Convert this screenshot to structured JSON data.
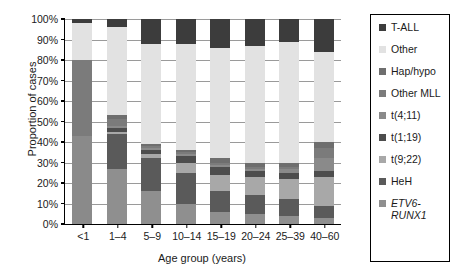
{
  "chart_data": {
    "type": "bar",
    "stacked": true,
    "title": "",
    "xlabel": "Age group (years)",
    "ylabel": "Proportion of cases",
    "ylim": [
      0,
      100
    ],
    "yunit": "%",
    "ytick_labels": [
      "0%",
      "10%",
      "20%",
      "30%",
      "40%",
      "50%",
      "60%",
      "70%",
      "80%",
      "90%",
      "100%"
    ],
    "ytick_values": [
      0,
      10,
      20,
      30,
      40,
      50,
      60,
      70,
      80,
      90,
      100
    ],
    "grid": true,
    "legend_position": "right",
    "categories": [
      "<1",
      "1–4",
      "5–9",
      "10–14",
      "15–19",
      "20–24",
      "25–39",
      "40–60"
    ],
    "series": [
      {
        "name": "ETV6-RUNX1",
        "italic": true,
        "color": "#8f8f8f",
        "values": [
          0,
          27,
          16,
          10,
          6,
          5,
          4,
          3
        ]
      },
      {
        "name": "HeH",
        "color": "#5a5a5a",
        "values": [
          0,
          17,
          16,
          15,
          10,
          9,
          8,
          6
        ]
      },
      {
        "name": "t(9;22)",
        "color": "#a8a8a8",
        "values": [
          0,
          1,
          2,
          5,
          8,
          9,
          10,
          14
        ]
      },
      {
        "name": "t(1;19)",
        "color": "#4d4d4d",
        "values": [
          0,
          2,
          2,
          3,
          4,
          3,
          3,
          3
        ]
      },
      {
        "name": "t(4;11)",
        "color": "#8a8a8a",
        "values": [
          43,
          1,
          1,
          1,
          1,
          1,
          2,
          6
        ]
      },
      {
        "name": "Other MLL",
        "color": "#7b7b7b",
        "values": [
          37,
          3,
          1,
          1,
          1,
          1,
          1,
          5
        ]
      },
      {
        "name": "Hap/hypo",
        "color": "#6e6e6e",
        "values": [
          0,
          2,
          1,
          1,
          2,
          2,
          2,
          3
        ]
      },
      {
        "name": "Other",
        "color": "#e2e2e2",
        "values": [
          18,
          43,
          49,
          52,
          54,
          57,
          59,
          44
        ]
      },
      {
        "name": "T-ALL",
        "color": "#3c3c3c",
        "values": [
          2,
          4,
          12,
          12,
          14,
          13,
          11,
          16
        ]
      }
    ]
  },
  "legend": {
    "items": [
      {
        "label": "T-ALL",
        "color": "#3c3c3c",
        "italic": false
      },
      {
        "label": "Other",
        "color": "#e2e2e2",
        "italic": false
      },
      {
        "label": "Hap/hypo",
        "color": "#6e6e6e",
        "italic": false
      },
      {
        "label": "Other MLL",
        "color": "#7b7b7b",
        "italic": false
      },
      {
        "label": "t(4;11)",
        "color": "#8a8a8a",
        "italic": false
      },
      {
        "label": "t(1;19)",
        "color": "#4d4d4d",
        "italic": false
      },
      {
        "label": "t(9;22)",
        "color": "#a8a8a8",
        "italic": false
      },
      {
        "label": "HeH",
        "color": "#5a5a5a",
        "italic": false
      },
      {
        "label": "ETV6-\nRUNX1",
        "color": "#8f8f8f",
        "italic": true
      }
    ]
  }
}
